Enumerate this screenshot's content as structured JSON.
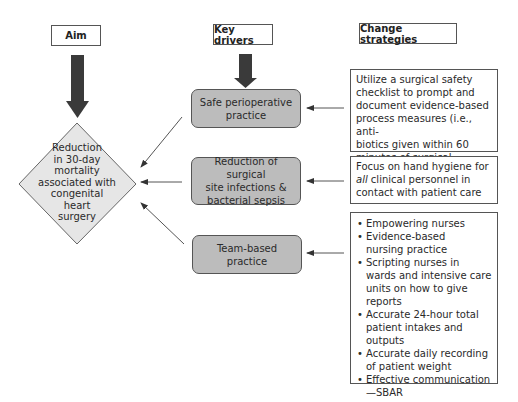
{
  "headers": {
    "aim": "Aim",
    "key_drivers": "Key drivers",
    "change_strategies": "Change strategies"
  },
  "aim": {
    "lines": [
      "Reduction",
      "in 30-day",
      "mortality",
      "associated with",
      "congenital",
      "heart",
      "surgery"
    ]
  },
  "drivers": [
    {
      "lines": [
        "Safe perioperative",
        "practice"
      ]
    },
    {
      "lines": [
        "Reduction of surgical",
        "site infections &",
        "bacterial sepsis"
      ]
    },
    {
      "lines": [
        "Team-based practice"
      ]
    }
  ],
  "strategies": [
    {
      "text": "Utilize a surgical safety checklist to prompt and document evidence-based process measures (i.e., anti-biotics given within 60 minutes of surgical incision)",
      "lines": [
        "Utilize a surgical safety",
        "checklist to prompt and",
        "document evidence-based",
        "process measures (i.e., anti-",
        "biotics given within 60",
        "minutes of surgical incision)"
      ]
    },
    {
      "italic_prefix": "all",
      "lines_pre": "Focus on hand hygiene for",
      "line2_rest": " clinical personnel in",
      "line3": "contact with patient care"
    },
    {
      "bullets": [
        "Empowering nurses",
        "Evidence-based nursing practice",
        "Scripting nurses in wards and intensive care units on how to give reports",
        "Accurate 24-hour total patient intakes and outputs",
        "Accurate daily recording of patient weight",
        "Effective communication—SBAR"
      ]
    }
  ],
  "colors": {
    "driver_fill": "#bcbcbc",
    "diamond_fill": "#e6e6e6",
    "big_arrow": "#3a3a3a",
    "line": "#555555"
  }
}
